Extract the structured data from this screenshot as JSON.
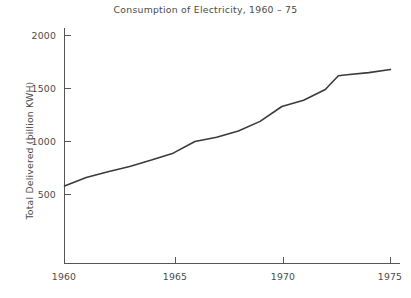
{
  "chart_data": {
    "type": "line",
    "title": "Consumption of Electricity, 1960 – 75",
    "xlabel": "",
    "ylabel": "Total Delivered (billion KWH)",
    "xlim": [
      1960,
      1975.6
    ],
    "ylim": [
      0,
      2120
    ],
    "grid": false,
    "legend": null,
    "x_ticks": [
      1960,
      1965,
      1970,
      1975
    ],
    "x_tick_labels": [
      "1960",
      "1965",
      "1970",
      "1975"
    ],
    "y_ticks": [
      500,
      1000,
      1500,
      2000
    ],
    "y_tick_labels": [
      "500",
      "1000",
      "1500",
      "2000"
    ],
    "series": [
      {
        "name": "Total Delivered",
        "x": [
          1960,
          1961,
          1962,
          1963,
          1964,
          1965,
          1966,
          1967,
          1968,
          1969,
          1970,
          1971,
          1972,
          1972.6,
          1973,
          1974,
          1975
        ],
        "values": [
          580,
          660,
          715,
          765,
          825,
          890,
          1000,
          1040,
          1100,
          1190,
          1330,
          1390,
          1490,
          1620,
          1630,
          1650,
          1680
        ]
      }
    ],
    "line_color": "#3a3a3a",
    "line_width": 1.6,
    "axis_color": "#555555",
    "text_color": "#4a4a4a",
    "background_color": "#ffffff"
  },
  "axes": {
    "y_title": "Total Delivered (billion KWH)"
  }
}
